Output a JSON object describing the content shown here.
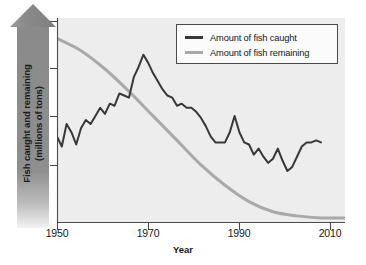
{
  "chart_data": {
    "type": "line",
    "title": "",
    "xlabel": "Year",
    "ylabel": "Fish caught and remaining (millions of tons)",
    "ylabel_line1": "Fish caught and remaining",
    "ylabel_line2": "(millions of tons)",
    "xlim": [
      1950,
      2010
    ],
    "ylim": [
      0,
      100
    ],
    "grid": false,
    "xticks": [
      1950,
      1970,
      1990,
      2010
    ],
    "xticklabels": [
      "1950",
      "1970",
      "1990",
      "2010"
    ],
    "yticks": [
      25,
      50,
      75,
      100
    ],
    "yticklabels": [
      "",
      "",
      "",
      ""
    ],
    "legend_position": "top-right",
    "series": [
      {
        "name": "Amount of fish caught",
        "color": "#38383a",
        "x": [
          1950,
          1951,
          1952,
          1953,
          1954,
          1955,
          1956,
          1957,
          1958,
          1959,
          1960,
          1961,
          1962,
          1963,
          1964,
          1965,
          1966,
          1967,
          1968,
          1969,
          1970,
          1971,
          1972,
          1973,
          1974,
          1975,
          1976,
          1977,
          1978,
          1979,
          1980,
          1981,
          1982,
          1983,
          1984,
          1985,
          1986,
          1987,
          1988,
          1989,
          1990,
          1991,
          1992,
          1993,
          1994,
          1995,
          1996,
          1997,
          1998,
          1999,
          2000,
          2001,
          2002,
          2003,
          2004,
          2005
        ],
        "values": [
          42,
          37,
          48,
          44,
          38,
          46,
          50,
          48,
          52,
          56,
          53,
          58,
          57,
          63,
          62,
          61,
          71,
          76,
          82,
          78,
          73,
          69,
          65,
          62,
          61,
          57,
          58,
          56,
          56,
          54,
          51,
          47,
          42,
          39,
          39,
          39,
          44,
          52,
          44,
          39,
          38,
          33,
          36,
          32,
          29,
          31,
          36,
          30,
          25,
          27,
          32,
          37,
          39,
          39,
          40,
          39
        ],
        "linewidth": 2.0
      },
      {
        "name": "Amount of fish remaining",
        "color": "#a9a9a9",
        "x": [
          1950,
          1955,
          1960,
          1965,
          1970,
          1975,
          1980,
          1985,
          1990,
          1995,
          2000,
          2005,
          2010
        ],
        "values": [
          90,
          84,
          75,
          64,
          52,
          40,
          28,
          18,
          10,
          5,
          3,
          2,
          2
        ],
        "linewidth": 3.0
      }
    ]
  },
  "legend": {
    "items": [
      {
        "label": "Amount of fish caught",
        "color": "#38383a"
      },
      {
        "label": "Amount of fish remaining",
        "color": "#a9a9a9"
      }
    ]
  },
  "axes": {
    "x_title": "Year",
    "y_title_line1": "Fish caught and remaining",
    "y_title_line2": "(millions of tons)",
    "x_labels": [
      "1950",
      "1970",
      "1990",
      "2010"
    ]
  },
  "colors": {
    "plot_background": "#ededed",
    "page_background": "#ffffff",
    "axis": "#4a4a4a",
    "arrow": "#8a8a8a",
    "caught_line": "#38383a",
    "remaining_line": "#a9a9a9"
  }
}
